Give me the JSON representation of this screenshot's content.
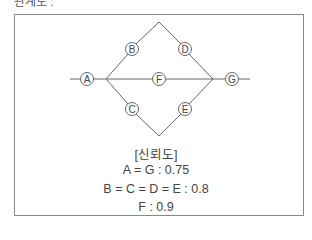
{
  "header": {
    "partial_text": "관계도 :"
  },
  "diagram": {
    "nodes": [
      {
        "id": "A",
        "x": 87,
        "y": 79
      },
      {
        "id": "B",
        "x": 132,
        "y": 49
      },
      {
        "id": "C",
        "x": 132,
        "y": 109
      },
      {
        "id": "D",
        "x": 185,
        "y": 49
      },
      {
        "id": "E",
        "x": 185,
        "y": 109
      },
      {
        "id": "F",
        "x": 159,
        "y": 79
      },
      {
        "id": "G",
        "x": 232,
        "y": 79
      }
    ]
  },
  "legend": {
    "title": "[신뢰도]",
    "lines": [
      "A = G : 0.75",
      "B = C = D = E : 0.8",
      "F : 0.9"
    ]
  },
  "reliability": {
    "A": 0.75,
    "G": 0.75,
    "B": 0.8,
    "C": 0.8,
    "D": 0.8,
    "E": 0.8,
    "F": 0.9
  }
}
